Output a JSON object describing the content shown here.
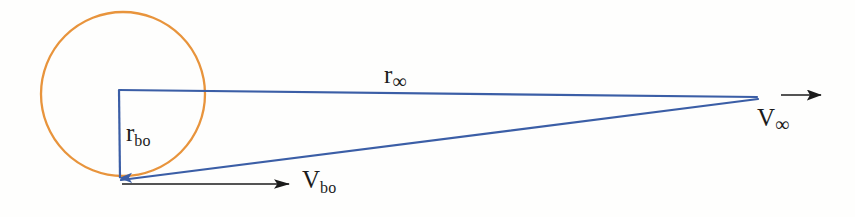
{
  "figure": {
    "background_color": "#fefefd"
  },
  "colors": {
    "circle_stroke": "#e8943c",
    "blue_line": "#3b5ea6",
    "arrow_black": "#1b1b1b",
    "background": "#fefefd"
  },
  "labels": {
    "r_bo": {
      "base": "r",
      "sub": "bo"
    },
    "r_inf": {
      "base": "r",
      "sub": "∞"
    },
    "v_bo": {
      "base": "V",
      "sub": "bo"
    },
    "v_inf": {
      "base": "V",
      "sub": "∞"
    }
  },
  "geometry": {
    "circle": {
      "cx": 123,
      "cy": 94,
      "r": 82,
      "stroke_width": 2.2
    },
    "apex": {
      "x": 758,
      "y": 98
    },
    "top_corner": {
      "x": 119,
      "y": 90
    },
    "bottom_vertex": {
      "x": 120,
      "y": 180
    },
    "r_bo_arrow": {
      "x1": 119,
      "y1": 90,
      "x2": 120,
      "y2": 178
    },
    "r_inf_line": {
      "x1": 119,
      "y1": 90,
      "x2": 757,
      "y2": 97
    },
    "hypotenuse_line": {
      "x1": 121,
      "y1": 180,
      "x2": 758,
      "y2": 99
    },
    "v_bo_arrow": {
      "x1": 122,
      "y1": 184,
      "x2": 289,
      "y2": 184
    },
    "v_inf_arrow": {
      "x1": 781,
      "y1": 95,
      "x2": 821,
      "y2": 95
    }
  }
}
